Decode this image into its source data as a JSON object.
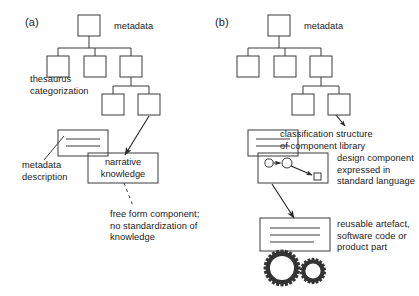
{
  "figure": {
    "type": "diagram",
    "background_color": "#ffffff",
    "line_color": "#3a3a3a",
    "text_color": "#1a1a1a"
  },
  "panel_a": {
    "letter": "(a)",
    "tree": {
      "root_label": "metadata",
      "levels": [
        1,
        3,
        2
      ],
      "node_shape": "square"
    },
    "labels": {
      "thesaurus": "thesaurus\ncategorization",
      "metadata_description": "metadata\ndescription",
      "free_form": "free form component;\nno standardization of\nknowledge"
    },
    "boxes": {
      "document": {
        "name": "metadata-description-document",
        "lines": 2
      },
      "narrative": {
        "name": "narrative-knowledge-box",
        "text": "narrative\nknowledge"
      }
    }
  },
  "panel_b": {
    "letter": "(b)",
    "tree": {
      "root_label": "metadata",
      "levels": [
        1,
        3,
        2
      ],
      "node_shape": "square"
    },
    "labels": {
      "classification": "classification structure\nof component library",
      "design_component": "design component\nexpressed in\nstandard language",
      "reusable_artefact": "reusable artefact,\nsoftware code or\nproduct part"
    },
    "boxes": {
      "document": {
        "name": "metadata-description-document",
        "lines": 2
      },
      "design_component": {
        "name": "design-component-box",
        "content": "node-link graph: two circles joined by arrow, diagonal arrow to small square node"
      },
      "artefact": {
        "name": "reusable-artefact-box",
        "lines": 3
      },
      "gears": {
        "name": "gears-icon",
        "count": 2
      }
    }
  }
}
